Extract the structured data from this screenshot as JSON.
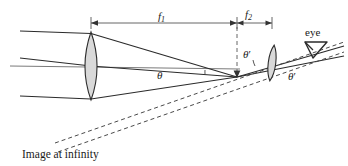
{
  "figure": {
    "caption": "Image at infinity",
    "labels": {
      "f1_base": "f",
      "f1_sub": "1",
      "f2_base": "f",
      "f2_sub": "2",
      "theta": "θ",
      "theta_prime_inner": "θ",
      "theta_prime_inner_mark": "′",
      "theta_prime_outer": "θ",
      "theta_prime_outer_mark": "′",
      "eye": "eye"
    },
    "icons": {
      "eye_symbol": "eye-triangle-icon",
      "objective_lens": "convex-lens-icon",
      "eyepiece_lens": "convex-lens-icon",
      "f1_dimension": "double-headed-arrow-icon",
      "f2_dimension": "double-headed-arrow-icon",
      "focal_point_arrow": "arrowhead-icon"
    },
    "colors": {
      "stroke": "#2b2b2b",
      "lens_fill": "#d9d9d9",
      "axis": "#6e6e6e",
      "dimension": "#555555",
      "dashed": "#4a4a4a",
      "background": "#ffffff"
    },
    "geometry": {
      "objective_lens_x": 91,
      "eyepiece_lens_x": 272,
      "focal_point_x": 237,
      "focal_point_y": 77,
      "optical_axis_y": 66,
      "f1_span": [
        91,
        237
      ],
      "f2_span": [
        237,
        272
      ],
      "canvas": [
        348,
        166
      ]
    }
  }
}
